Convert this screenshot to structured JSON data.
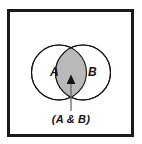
{
  "figure": {
    "type": "venn-diagram",
    "title": "",
    "border_color": "#1a1a1a",
    "background_color": "#ffffff"
  },
  "sets": {
    "left": {
      "label": "A",
      "fill": "#ffffff",
      "stroke": "#141414"
    },
    "right": {
      "label": "B",
      "fill": "#ffffff",
      "stroke": "#141414"
    }
  },
  "intersection": {
    "label": "(A & B)",
    "fill": "#b9b9b9",
    "stroke": "#141414",
    "highlighted": true
  },
  "annotation": {
    "caption": "(A & B)",
    "arrow": {
      "name": "callout-arrow",
      "color": "#4a4a4a",
      "head_color": "#141414",
      "direction": "up"
    }
  }
}
